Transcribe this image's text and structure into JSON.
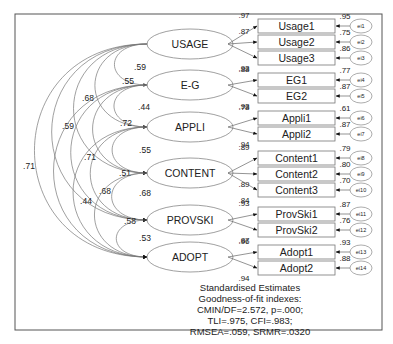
{
  "title": "Standardised Estimates",
  "fit": {
    "heading": "Goodness-of-fit indexes:",
    "line1": "CMIN/DF=2.572, p=.000;",
    "line2": "TLI=.975, CFI=.983;",
    "line3": "RMSEA=.059, SRMR=.0320"
  },
  "latents": [
    {
      "id": "USAGE",
      "label": "USAGE",
      "cy": 44
    },
    {
      "id": "EG",
      "label": "E-G",
      "cy": 85
    },
    {
      "id": "APPLI",
      "label": "APPLI",
      "cy": 127
    },
    {
      "id": "CONTENT",
      "label": "CONTENT",
      "cy": 173
    },
    {
      "id": "PROVSKI",
      "label": "PROVSKI",
      "cy": 220
    },
    {
      "id": "ADOPT",
      "label": "ADOPT",
      "cy": 257
    }
  ],
  "indicators": [
    {
      "label": "Usage1",
      "latent": "USAGE",
      "loading": ".97",
      "r2": ".95",
      "error": "ei1",
      "y": 19
    },
    {
      "label": "Usage2",
      "latent": "USAGE",
      "loading": ".87",
      "r2": ".75",
      "error": "ei2",
      "y": 35
    },
    {
      "label": "Usage3",
      "latent": "USAGE",
      "loading": ".93",
      "r2": ".86",
      "error": "ei3",
      "y": 51
    },
    {
      "label": "EG1",
      "latent": "EG",
      "loading": ".88",
      "r2": ".77",
      "error": "ei4",
      "y": 73
    },
    {
      "label": "EG2",
      "latent": "EG",
      "loading": ".93",
      "r2": ".87",
      "error": "ei5",
      "y": 89
    },
    {
      "label": "Appli1",
      "latent": "APPLI",
      "loading": ".78",
      "r2": ".61",
      "error": "ei6",
      "y": 111
    },
    {
      "label": "Appli2",
      "latent": "APPLI",
      "loading": ".94",
      "r2": ".87",
      "error": "ei7",
      "y": 127
    },
    {
      "label": "Content1",
      "latent": "CONTENT",
      "loading": ".89",
      "r2": ".79",
      "error": "ei8",
      "y": 151
    },
    {
      "label": "Content2",
      "latent": "CONTENT",
      "loading": ".89",
      "r2": ".80",
      "error": "ei9",
      "y": 167
    },
    {
      "label": "Content3",
      "latent": "CONTENT",
      "loading": ".84",
      "r2": ".70",
      "error": "ei10",
      "y": 183
    },
    {
      "label": "ProvSki1",
      "latent": "PROVSKI",
      "loading": ".93",
      "r2": ".87",
      "error": "ei11",
      "y": 207
    },
    {
      "label": "ProvSki2",
      "latent": "PROVSKI",
      "loading": ".87",
      "r2": ".76",
      "error": "ei12",
      "y": 223
    },
    {
      "label": "Adopt1",
      "latent": "ADOPT",
      "loading": ".96",
      "r2": ".93",
      "error": "ei13",
      "y": 245
    },
    {
      "label": "Adopt2",
      "latent": "ADOPT",
      "loading": ".94",
      "r2": ".88",
      "error": "ei14",
      "y": 261
    }
  ],
  "correlations": [
    {
      "from": "USAGE",
      "to": "EG",
      "value": ".59"
    },
    {
      "from": "USAGE",
      "to": "APPLI",
      "value": ".55"
    },
    {
      "from": "USAGE",
      "to": "CONTENT",
      "value": ".68"
    },
    {
      "from": "USAGE",
      "to": "PROVSKI",
      "value": ".59"
    },
    {
      "from": "USAGE",
      "to": "ADOPT",
      "value": ".71"
    },
    {
      "from": "EG",
      "to": "APPLI",
      "value": ".44"
    },
    {
      "from": "EG",
      "to": "CONTENT",
      "value": ".72"
    },
    {
      "from": "EG",
      "to": "PROVSKI",
      "value": ".71"
    },
    {
      "from": "EG",
      "to": "ADOPT",
      "value": ".44"
    },
    {
      "from": "APPLI",
      "to": "CONTENT",
      "value": ".55"
    },
    {
      "from": "APPLI",
      "to": "PROVSKI",
      "value": ".51"
    },
    {
      "from": "APPLI",
      "to": "ADOPT",
      "value": ".68"
    },
    {
      "from": "CONTENT",
      "to": "PROVSKI",
      "value": ".68"
    },
    {
      "from": "CONTENT",
      "to": "ADOPT",
      "value": ".58"
    },
    {
      "from": "PROVSKI",
      "to": "ADOPT",
      "value": ".53"
    }
  ]
}
